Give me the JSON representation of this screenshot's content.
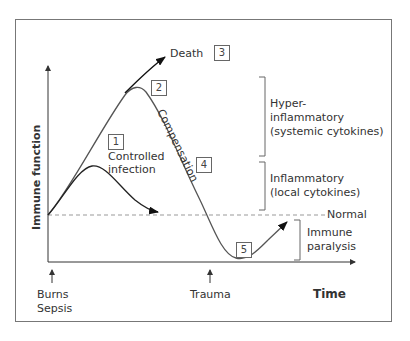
{
  "diagram": {
    "y_axis_label": "Immune function",
    "x_axis_label": "Time",
    "baseline_label": "Normal",
    "events": {
      "start_line1": "Burns",
      "start_line2": "Sepsis",
      "second_hit": "Trauma"
    },
    "curve_labels": {
      "death": "Death",
      "controlled_line1": "Controlled",
      "controlled_line2": "infection",
      "compensation": "Compensation"
    },
    "numbered_boxes": [
      "1",
      "2",
      "3",
      "4",
      "5"
    ],
    "zones": {
      "hyper_line1": "Hyper-",
      "hyper_line2": "inflammatory",
      "hyper_line3": "(systemic cytokines)",
      "inflam_line1": "Inflammatory",
      "inflam_line2": "(local cytokines)",
      "paralysis_line1": "Immune",
      "paralysis_line2": "paralysis"
    },
    "colors": {
      "curve": "#555555",
      "arrow": "#111111",
      "frame": "#777777",
      "dashed": "#999999"
    }
  }
}
